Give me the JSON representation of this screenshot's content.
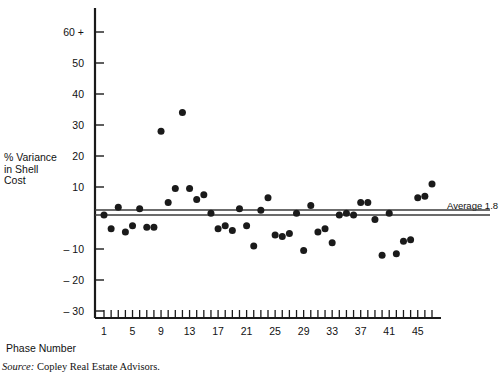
{
  "figure": {
    "ylabel_text": "% Variance\nin Shell\nCost",
    "xlabel_text": "Phase Number",
    "average_label": "Average 1.8",
    "source_prefix": "Source:",
    "source_body": " Copley Real Estate Advisors."
  },
  "chart_data": {
    "type": "scatter",
    "title": "",
    "xlabel": "Phase Number",
    "ylabel": "% Variance in Shell Cost",
    "xlim": [
      0,
      48
    ],
    "ylim": [
      -35,
      65
    ],
    "grid": false,
    "legend": "none",
    "y_ticks": [
      60,
      50,
      40,
      30,
      20,
      10,
      -10,
      -20,
      -30
    ],
    "y_tick_labels": [
      "60 +",
      "50",
      "40",
      "30",
      "20",
      "10",
      "– 10",
      "– 20",
      "– 30"
    ],
    "x_ticks": [
      1,
      5,
      9,
      13,
      17,
      21,
      25,
      29,
      33,
      37,
      41,
      45
    ],
    "x_tick_labels": [
      "1",
      "5",
      "9",
      "13",
      "17",
      "21",
      "25",
      "29",
      "33",
      "37",
      "41",
      "45"
    ],
    "x_minor_tick_step": 1,
    "x_minor_tick_range": [
      1,
      47
    ],
    "marker": "filled-circle",
    "marker_color": "#1a1a1a",
    "marker_size_px": 7,
    "reference_line": {
      "label": "Average 1.8",
      "value": 1.8,
      "style": "double-horizontal-line",
      "color": "#3a3a3a"
    },
    "x": [
      1,
      2,
      3,
      4,
      5,
      6,
      7,
      8,
      9,
      10,
      11,
      12,
      13,
      14,
      15,
      16,
      17,
      18,
      19,
      20,
      21,
      22,
      23,
      24,
      25,
      26,
      27,
      28,
      29,
      30,
      31,
      32,
      33,
      34,
      35,
      36,
      37,
      38,
      39,
      40,
      41,
      42,
      43,
      44,
      45,
      46,
      47
    ],
    "values": [
      1.0,
      -3.5,
      3.5,
      -4.5,
      -2.5,
      3.0,
      -3.0,
      -3.0,
      28.0,
      5.0,
      9.5,
      34.0,
      9.5,
      6.0,
      7.5,
      1.5,
      -3.5,
      -2.5,
      -4.0,
      3.0,
      -2.5,
      -9.0,
      2.5,
      6.5,
      -5.5,
      -6.0,
      -5.0,
      1.5,
      -10.5,
      4.0,
      -4.5,
      -3.5,
      -8.0,
      1.0,
      1.5,
      1.0,
      5.0,
      5.0,
      -0.5,
      -12.0,
      1.5,
      -11.5,
      -7.5,
      -7.0,
      6.5,
      7.0,
      11.0
    ]
  }
}
